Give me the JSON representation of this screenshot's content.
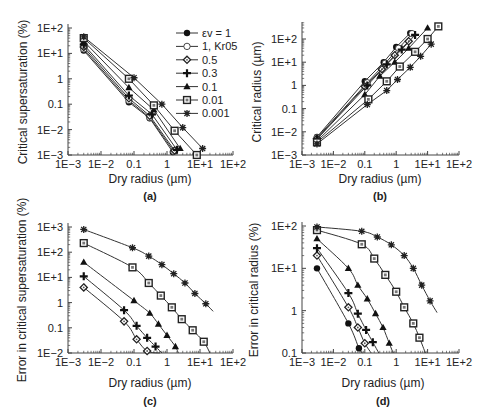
{
  "figure": {
    "panels": [
      "(a)",
      "(b)",
      "(c)",
      "(d)"
    ]
  },
  "legend": {
    "entries": [
      {
        "label": "εv = 1",
        "marker": "filled-circle"
      },
      {
        "label": "1, Kr05",
        "marker": "open-circle"
      },
      {
        "label": "0.5",
        "marker": "dotted-diamond"
      },
      {
        "label": "0.3",
        "marker": "plus"
      },
      {
        "label": "0.1",
        "marker": "filled-triangle"
      },
      {
        "label": "0.01",
        "marker": "dotted-square"
      },
      {
        "label": "0.001",
        "marker": "star"
      }
    ]
  },
  "colors": {
    "line": "#333333",
    "axis": "#444444",
    "background": "#ffffff"
  },
  "chart_data": [
    {
      "id": "a",
      "panel_label": "(a)",
      "type": "line",
      "title": "",
      "xlabel": "Dry radius (µm)",
      "ylabel": "Critical supersaturation (%)",
      "xscale": "log",
      "yscale": "log",
      "xlim": [
        0.001,
        100
      ],
      "ylim": [
        0.001,
        100
      ],
      "xticks": [
        "1E−3",
        "1E−2",
        "0.1",
        "1",
        "1E+1",
        "1E+2"
      ],
      "yticks": [
        "1E−3",
        "1E−2",
        "0.1",
        "1",
        "1E+1",
        "1E+2"
      ],
      "legend_position": "upper right",
      "series": [
        {
          "name": "εv = 1",
          "marker": "filled-circle",
          "x": [
            0.003,
            0.07,
            0.3,
            1.5
          ],
          "y": [
            13,
            0.12,
            0.028,
            0.0013
          ]
        },
        {
          "name": "1, Kr05",
          "marker": "open-circle",
          "x": [
            0.003,
            0.07,
            0.3,
            1.6
          ],
          "y": [
            15,
            0.14,
            0.03,
            0.0014
          ]
        },
        {
          "name": "0.5",
          "marker": "dotted-diamond",
          "x": [
            0.003,
            0.07,
            0.3,
            1.7
          ],
          "y": [
            18,
            0.17,
            0.035,
            0.0015
          ]
        },
        {
          "name": "0.3",
          "marker": "plus",
          "x": [
            0.003,
            0.07,
            0.35,
            2.0
          ],
          "y": [
            22,
            0.22,
            0.04,
            0.0016
          ]
        },
        {
          "name": "0.1",
          "marker": "filled-triangle",
          "x": [
            0.003,
            0.07,
            0.4,
            2.5
          ],
          "y": [
            30,
            0.45,
            0.06,
            0.0018
          ]
        },
        {
          "name": "0.01",
          "marker": "dotted-square",
          "x": [
            0.003,
            0.07,
            0.4,
            1.7,
            8
          ],
          "y": [
            40,
            1.0,
            0.09,
            0.009,
            0.001
          ]
        },
        {
          "name": "0.001",
          "marker": "star",
          "x": [
            0.003,
            0.1,
            0.7,
            3,
            12
          ],
          "y": [
            45,
            1.1,
            0.1,
            0.012,
            0.0018
          ]
        }
      ]
    },
    {
      "id": "b",
      "panel_label": "(b)",
      "type": "line",
      "title": "",
      "xlabel": "Dry radius (µm)",
      "ylabel": "Critical radius (µm)",
      "xscale": "log",
      "yscale": "log",
      "xlim": [
        0.001,
        100
      ],
      "ylim": [
        0.001,
        500
      ],
      "xticks": [
        "1E−3",
        "1E−2",
        "0.1",
        "1",
        "1E+1",
        "1E+2"
      ],
      "yticks": [
        "1E−3",
        "1E−2",
        "0.1",
        "1",
        "1E+1",
        "1E+2"
      ],
      "series": [
        {
          "name": "εv = 1",
          "marker": "filled-circle",
          "x": [
            0.003,
            0.1,
            0.4,
            1.0,
            2.8
          ],
          "y": [
            0.006,
            1.5,
            10,
            45,
            180
          ]
        },
        {
          "name": "1, Kr05",
          "marker": "open-circle",
          "x": [
            0.003,
            0.12,
            0.45,
            1.2,
            3.2
          ],
          "y": [
            0.0055,
            1.3,
            9,
            40,
            170
          ]
        },
        {
          "name": "0.5",
          "marker": "dotted-diamond",
          "x": [
            0.003,
            0.1,
            0.35,
            0.9,
            2.5
          ],
          "y": [
            0.005,
            0.9,
            5,
            20,
            80
          ]
        },
        {
          "name": "0.3",
          "marker": "plus",
          "x": [
            0.003,
            0.12,
            0.5,
            1.5,
            4
          ],
          "y": [
            0.0048,
            1.0,
            8,
            35,
            150
          ]
        },
        {
          "name": "0.1",
          "marker": "filled-triangle",
          "x": [
            0.003,
            0.1,
            0.3,
            0.9,
            2.5,
            10
          ],
          "y": [
            0.004,
            0.4,
            2.5,
            10,
            40,
            300
          ]
        },
        {
          "name": "0.01",
          "marker": "dotted-square",
          "x": [
            0.003,
            0.13,
            0.5,
            1.3,
            4,
            10,
            22
          ],
          "y": [
            0.0035,
            0.25,
            1.5,
            6.5,
            28,
            100,
            350
          ]
        },
        {
          "name": "0.001",
          "marker": "star",
          "x": [
            0.003,
            0.12,
            0.5,
            1.1,
            2.8,
            6,
            13
          ],
          "y": [
            0.003,
            0.15,
            0.6,
            1.8,
            6,
            18,
            60
          ]
        }
      ]
    },
    {
      "id": "c",
      "panel_label": "(c)",
      "type": "line",
      "title": "",
      "xlabel": "Dry radius (µm)",
      "ylabel": "Error in critical supersaturation (%)",
      "xscale": "log",
      "yscale": "log",
      "xlim": [
        0.001,
        100
      ],
      "ylim": [
        0.01,
        1000
      ],
      "xticks": [
        "1E−3",
        "1E−2",
        "0.1",
        "1",
        "1E+1",
        "1E+2"
      ],
      "yticks": [
        "1E−2",
        "0.1",
        "1",
        "1E+1",
        "1E+2",
        "1E+3"
      ],
      "series": [
        {
          "name": "0.5",
          "marker": "dotted-diamond",
          "x": [
            0.003,
            0.05,
            0.12,
            0.25
          ],
          "y": [
            4,
            0.18,
            0.035,
            0.012
          ],
          "line_end": [
            0.6,
            0.01
          ]
        },
        {
          "name": "0.3",
          "marker": "plus",
          "x": [
            0.003,
            0.05,
            0.12,
            0.25,
            0.45
          ],
          "y": [
            11,
            0.5,
            0.12,
            0.04,
            0.018
          ],
          "line_end": [
            0.7,
            0.01
          ]
        },
        {
          "name": "0.1",
          "marker": "filled-triangle",
          "x": [
            0.003,
            0.1,
            0.3,
            0.55,
            1.0,
            1.8
          ],
          "y": [
            40,
            1.2,
            0.38,
            0.14,
            0.05,
            0.018
          ],
          "line_end": [
            2.2,
            0.01
          ]
        },
        {
          "name": "0.01",
          "marker": "dotted-square",
          "x": [
            0.003,
            0.09,
            0.28,
            0.65,
            1.4,
            2.8,
            6,
            13
          ],
          "y": [
            230,
            25,
            6,
            1.9,
            0.65,
            0.22,
            0.08,
            0.028
          ],
          "line_end": [
            20,
            0.01
          ]
        },
        {
          "name": "0.001",
          "marker": "star",
          "x": [
            0.003,
            0.09,
            0.28,
            0.7,
            1.6,
            3.5,
            7,
            15
          ],
          "y": [
            800,
            150,
            70,
            32,
            14,
            6,
            2.3,
            0.9
          ],
          "line_end": [
            25,
            0.45
          ]
        }
      ]
    },
    {
      "id": "d",
      "panel_label": "(d)",
      "type": "line",
      "title": "",
      "xlabel": "Dry radius (µm)",
      "ylabel": "Error in critical radius (%)",
      "xscale": "log",
      "yscale": "log",
      "xlim": [
        0.001,
        100
      ],
      "ylim": [
        0.1,
        100
      ],
      "xticks": [
        "1E−3",
        "1E−2",
        "0.1",
        "1",
        "1E+1",
        "1E+2"
      ],
      "yticks": [
        "0.1",
        "1",
        "1E+1",
        "1E+2"
      ],
      "series": [
        {
          "name": "εv = 1",
          "marker": "filled-circle",
          "x": [
            0.003,
            0.03,
            0.065
          ],
          "y": [
            10,
            0.5,
            0.13
          ],
          "line_end": [
            0.085,
            0.1
          ]
        },
        {
          "name": "0.5",
          "marker": "dotted-diamond",
          "x": [
            0.003,
            0.03,
            0.06,
            0.1
          ],
          "y": [
            20,
            1.2,
            0.4,
            0.17
          ],
          "line_end": [
            0.16,
            0.1
          ]
        },
        {
          "name": "0.3",
          "marker": "plus",
          "x": [
            0.003,
            0.03,
            0.06,
            0.11,
            0.18
          ],
          "y": [
            30,
            2.6,
            0.85,
            0.35,
            0.18
          ],
          "line_end": [
            0.28,
            0.1
          ]
        },
        {
          "name": "0.1",
          "marker": "filled-triangle",
          "x": [
            0.003,
            0.03,
            0.06,
            0.12,
            0.22,
            0.38,
            0.6
          ],
          "y": [
            50,
            10,
            4,
            1.9,
            0.85,
            0.4,
            0.17
          ],
          "line_end": [
            0.8,
            0.1
          ]
        },
        {
          "name": "0.01",
          "marker": "dotted-square",
          "x": [
            0.003,
            0.08,
            0.2,
            0.45,
            1.0,
            1.8,
            3.5,
            5.5
          ],
          "y": [
            80,
            37,
            17,
            7,
            2.8,
            1.2,
            0.5,
            0.23
          ],
          "line_end": [
            8.5,
            0.1
          ]
        },
        {
          "name": "0.001",
          "marker": "star",
          "x": [
            0.003,
            0.08,
            0.25,
            0.7,
            1.8,
            3.5,
            6.5,
            12
          ],
          "y": [
            95,
            75,
            55,
            36,
            20,
            10,
            4,
            1.7
          ],
          "line_end": [
            20,
            0.9
          ]
        }
      ]
    }
  ]
}
